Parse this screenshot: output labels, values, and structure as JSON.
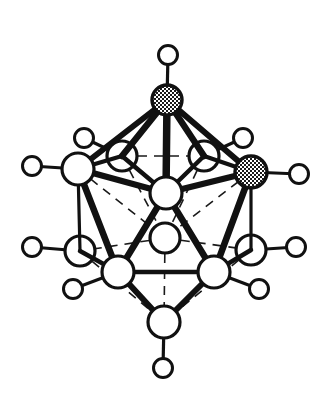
{
  "figure": {
    "formula": "C2B10H12",
    "background_color": "#ffffff",
    "line_color": "#111111",
    "atom_fill_open": "#ffffff",
    "atom_fill_hatched": "#9a9a9a"
  },
  "legend": {
    "open_circle_meaning": "boron vertex",
    "hatched_circle_meaning": "carbon vertex",
    "small_circle_meaning": "terminal hydrogen"
  },
  "counts": {
    "cage_vertices": 12,
    "carbon_vertices": 2,
    "boron_vertices": 10,
    "hydrogen_atoms": 12,
    "cage_edges": 30
  },
  "atoms": [
    {
      "id": "v1",
      "label": "C",
      "kind": "carbon",
      "depth": "front",
      "cx": 167,
      "cy": 100,
      "r": 15,
      "h": {
        "cx": 168,
        "cy": 55,
        "r": 9.5
      }
    },
    {
      "id": "v2",
      "label": "B",
      "kind": "boron",
      "depth": "rear",
      "cx": 122,
      "cy": 156,
      "r": 15,
      "h": {
        "cx": 84,
        "cy": 138,
        "r": 9.5
      }
    },
    {
      "id": "v3",
      "label": "B",
      "kind": "boron",
      "depth": "rear",
      "cx": 204,
      "cy": 156,
      "r": 15,
      "h": {
        "cx": 243,
        "cy": 138,
        "r": 9.5
      }
    },
    {
      "id": "v4",
      "label": "B",
      "kind": "boron",
      "depth": "front",
      "cx": 78,
      "cy": 169,
      "r": 16,
      "h": {
        "cx": 32,
        "cy": 166,
        "r": 9.5
      }
    },
    {
      "id": "v5",
      "label": "C",
      "kind": "carbon",
      "depth": "front",
      "cx": 251,
      "cy": 172,
      "r": 16,
      "h": {
        "cx": 299,
        "cy": 174,
        "r": 9.5
      }
    },
    {
      "id": "v6",
      "label": "B",
      "kind": "boron",
      "depth": "front",
      "cx": 166,
      "cy": 193,
      "r": 16,
      "h": null
    },
    {
      "id": "v7",
      "label": "B",
      "kind": "boron",
      "depth": "rear",
      "cx": 165,
      "cy": 238,
      "r": 15,
      "h": null
    },
    {
      "id": "v8",
      "label": "B",
      "kind": "boron",
      "depth": "rear",
      "cx": 80,
      "cy": 251,
      "r": 15,
      "h": {
        "cx": 32,
        "cy": 247,
        "r": 9.5
      }
    },
    {
      "id": "v9",
      "label": "B",
      "kind": "boron",
      "depth": "rear",
      "cx": 251,
      "cy": 250,
      "r": 15,
      "h": {
        "cx": 296,
        "cy": 247,
        "r": 9.5
      }
    },
    {
      "id": "v10",
      "label": "B",
      "kind": "boron",
      "depth": "front",
      "cx": 118,
      "cy": 272,
      "r": 16,
      "h": {
        "cx": 73,
        "cy": 289,
        "r": 9.5
      }
    },
    {
      "id": "v11",
      "label": "B",
      "kind": "boron",
      "depth": "front",
      "cx": 214,
      "cy": 272,
      "r": 16,
      "h": {
        "cx": 259,
        "cy": 289,
        "r": 9.5
      }
    },
    {
      "id": "v12",
      "label": "B",
      "kind": "boron",
      "depth": "front",
      "cx": 164,
      "cy": 322,
      "r": 16,
      "h": {
        "cx": 163,
        "cy": 368,
        "r": 9.5
      }
    }
  ],
  "bonds": [
    {
      "from": "v1",
      "to": "v2",
      "style": "front",
      "width": 6.5
    },
    {
      "from": "v1",
      "to": "v3",
      "style": "front",
      "width": 6.5
    },
    {
      "from": "v1",
      "to": "v4",
      "style": "front",
      "width": 6.0
    },
    {
      "from": "v1",
      "to": "v5",
      "style": "front",
      "width": 6.0
    },
    {
      "from": "v1",
      "to": "v6",
      "style": "front",
      "width": 7.5
    },
    {
      "from": "v2",
      "to": "v3",
      "style": "hidden",
      "width": 1.6
    },
    {
      "from": "v2",
      "to": "v4",
      "style": "front",
      "width": 4.0
    },
    {
      "from": "v2",
      "to": "v6",
      "style": "front",
      "width": 4.5
    },
    {
      "from": "v3",
      "to": "v5",
      "style": "front",
      "width": 4.0
    },
    {
      "from": "v3",
      "to": "v6",
      "style": "front",
      "width": 4.5
    },
    {
      "from": "v4",
      "to": "v6",
      "style": "front",
      "width": 6.0
    },
    {
      "from": "v5",
      "to": "v6",
      "style": "front",
      "width": 6.0
    },
    {
      "from": "v4",
      "to": "v8",
      "style": "mid",
      "width": 3.2
    },
    {
      "from": "v5",
      "to": "v9",
      "style": "mid",
      "width": 3.2
    },
    {
      "from": "v2",
      "to": "v7",
      "style": "hidden",
      "width": 1.6
    },
    {
      "from": "v3",
      "to": "v7",
      "style": "hidden",
      "width": 1.6
    },
    {
      "from": "v4",
      "to": "v7",
      "style": "hidden",
      "width": 1.6
    },
    {
      "from": "v5",
      "to": "v7",
      "style": "hidden",
      "width": 1.6
    },
    {
      "from": "v6",
      "to": "v10",
      "style": "front",
      "width": 6.5
    },
    {
      "from": "v6",
      "to": "v11",
      "style": "front",
      "width": 6.5
    },
    {
      "from": "v7",
      "to": "v8",
      "style": "hidden",
      "width": 1.6
    },
    {
      "from": "v7",
      "to": "v9",
      "style": "hidden",
      "width": 1.6
    },
    {
      "from": "v7",
      "to": "v12",
      "style": "hidden",
      "width": 1.6
    },
    {
      "from": "v4",
      "to": "v10",
      "style": "front",
      "width": 6.5
    },
    {
      "from": "v5",
      "to": "v11",
      "style": "front",
      "width": 6.5
    },
    {
      "from": "v8",
      "to": "v10",
      "style": "front",
      "width": 4.5
    },
    {
      "from": "v9",
      "to": "v11",
      "style": "front",
      "width": 4.5
    },
    {
      "from": "v8",
      "to": "v12",
      "style": "hidden",
      "width": 1.6
    },
    {
      "from": "v9",
      "to": "v12",
      "style": "hidden",
      "width": 1.6
    },
    {
      "from": "v10",
      "to": "v11",
      "style": "front",
      "width": 4.5
    },
    {
      "from": "v10",
      "to": "v12",
      "style": "front",
      "width": 6.0
    },
    {
      "from": "v11",
      "to": "v12",
      "style": "front",
      "width": 6.0
    }
  ]
}
